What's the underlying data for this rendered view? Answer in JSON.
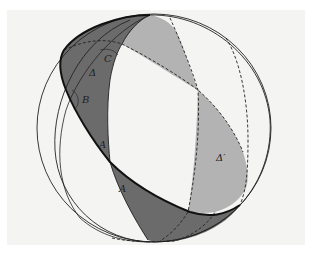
{
  "figure": {
    "labels": {
      "delta": "Δ",
      "delta_prime": "Δ′",
      "angle_a_upper": "A",
      "angle_a_lower": "A",
      "angle_b": "B",
      "angle_c": "C"
    },
    "colors": {
      "dark_lune": "#6b6b6b",
      "light_lune": "#b3b3b3",
      "background": "#f4f4f3",
      "stroke": "#111111"
    }
  }
}
